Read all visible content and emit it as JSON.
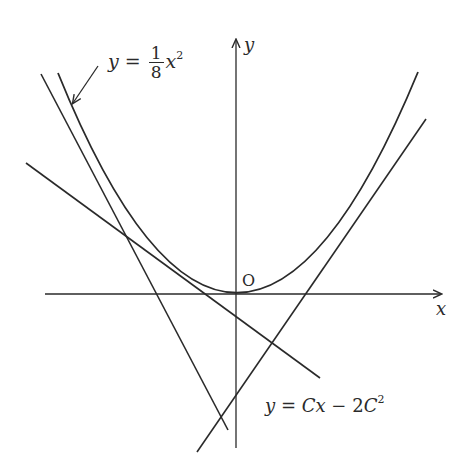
{
  "figure": {
    "type": "diagram",
    "axes": {
      "x_label": "x",
      "y_label": "y",
      "origin_label": "O"
    },
    "curve_label": {
      "lhs": "y",
      "eq": "=",
      "frac_num": "1",
      "frac_den": "8",
      "var": "x",
      "exp": "2"
    },
    "line_label": {
      "lhs": "y",
      "eq": " = ",
      "term1": "Cx",
      "minus": " − ",
      "coef": "2",
      "var": "C",
      "exp": "2"
    },
    "colors": {
      "stroke": "#2a2a2a",
      "background": "#ffffff"
    }
  }
}
